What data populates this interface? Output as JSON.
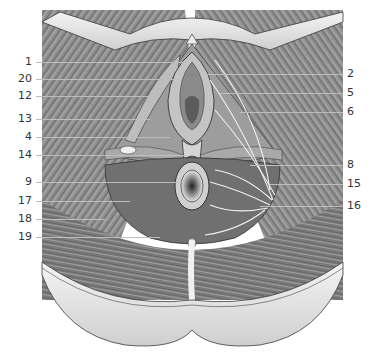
{
  "figure": {
    "palette": {
      "background": "#ffffff",
      "muscle_dark": "#6e6e6e",
      "muscle_mid": "#9a9a9a",
      "muscle_light": "#c8c8c8",
      "skin": "#d9d9d9",
      "skin_highlight": "#f2f2f2",
      "outline": "#3a3a3a",
      "leader_line": "#bdbdbd",
      "label_text": "#333333"
    }
  },
  "labels_left": [
    {
      "text": "1",
      "y": 62,
      "x_end": 185
    },
    {
      "text": "20",
      "y": 79,
      "x_end": 175
    },
    {
      "text": "12",
      "y": 96,
      "x_end": 160
    },
    {
      "text": "13",
      "y": 119,
      "x_end": 150
    },
    {
      "text": "4",
      "y": 137,
      "x_end": 170
    },
    {
      "text": "14",
      "y": 155,
      "x_end": 185
    },
    {
      "text": "9",
      "y": 182,
      "x_end": 185
    },
    {
      "text": "17",
      "y": 201,
      "x_end": 130
    },
    {
      "text": "18",
      "y": 219,
      "x_end": 105
    },
    {
      "text": "19",
      "y": 237,
      "x_end": 160
    }
  ],
  "labels_right": [
    {
      "text": "2",
      "y": 74,
      "x_start": 200
    },
    {
      "text": "5",
      "y": 93,
      "x_start": 220
    },
    {
      "text": "6",
      "y": 112,
      "x_start": 240
    },
    {
      "text": "8",
      "y": 165,
      "x_start": 250
    },
    {
      "text": "15",
      "y": 184,
      "x_start": 270
    },
    {
      "text": "16",
      "y": 206,
      "x_start": 260
    }
  ]
}
